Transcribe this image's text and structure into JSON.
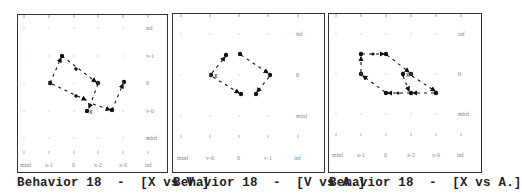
{
  "chart_data": [
    {
      "type": "scatter",
      "title": "Behavior 18  -  [X vs V.]",
      "xlabel": "X",
      "ylabel": "V",
      "x_tick_labels": [
        "minf",
        "x-1",
        "0",
        "x-2",
        "x-0",
        "inf"
      ],
      "y_tick_labels": [
        "inf",
        "v-1",
        "0",
        "v-0",
        "minf"
      ],
      "grid": "dotted",
      "start_marker": "x",
      "trajectory_qualitative": [
        {
          "x": "x-1",
          "y": "v-1"
        },
        {
          "x": "x-2",
          "y": "0"
        },
        {
          "x": "(0,x-2)",
          "y": "v-0"
        },
        {
          "x": "minf..x-1",
          "y": "0"
        },
        {
          "x": "x-2",
          "y": "v-0"
        },
        {
          "x": "x-0",
          "y": "0"
        }
      ]
    },
    {
      "type": "scatter",
      "title": "Behavior 18  -  [V vs A.]",
      "xlabel": "V",
      "ylabel": "A",
      "x_tick_labels": [
        "minf",
        "v-0",
        "0",
        "v-1",
        "inf"
      ],
      "y_tick_labels": [
        "inf",
        "0",
        "minf"
      ],
      "grid": "dotted",
      "start_marker": "x",
      "trajectory_qualitative": [
        {
          "x": "v-0",
          "y": "0"
        },
        {
          "x": "(v-0,0)",
          "y": "(0,inf)"
        },
        {
          "x": "0",
          "y": "(0,inf)"
        },
        {
          "x": "v-1",
          "y": "0"
        },
        {
          "x": "(0,v-1)",
          "y": "(minf,0)"
        },
        {
          "x": "0",
          "y": "(minf,0)"
        }
      ]
    },
    {
      "type": "scatter",
      "title": "Behavior 18  -  [X vs A.]",
      "xlabel": "X",
      "ylabel": "A",
      "x_tick_labels": [
        "minf",
        "x-1",
        "0",
        "x-2",
        "x-0",
        "inf"
      ],
      "y_tick_labels": [
        "inf",
        "0",
        "minf"
      ],
      "grid": "dotted",
      "start_marker": "x",
      "trajectory_qualitative": [
        {
          "x": "x-1",
          "y": "(0,inf)"
        },
        {
          "x": "0",
          "y": "(0,inf)"
        },
        {
          "x": "x-2",
          "y": "0"
        },
        {
          "x": "x-0",
          "y": "(minf,0)"
        },
        {
          "x": "x-2",
          "y": "(minf,0)"
        },
        {
          "x": "0",
          "y": "(minf,0)"
        },
        {
          "x": "x-1",
          "y": "0"
        }
      ]
    }
  ],
  "panels": [
    {
      "caption": "Behavior 18  -  [X vs V.]",
      "x_labels": [
        "minf",
        "x-1",
        "0",
        "x-2",
        "x-0",
        "inf"
      ],
      "y_labels": [
        "inf",
        "v-1",
        "0",
        "v-0",
        "minf"
      ]
    },
    {
      "caption": "Behavior 18  -  [V vs A.]",
      "x_labels": [
        "minf",
        "v-0",
        "0",
        "v-1",
        "inf"
      ],
      "y_labels": [
        "inf",
        "0",
        "minf"
      ]
    },
    {
      "caption": "Behavior 18  -  [X vs A.]",
      "x_labels": [
        "minf",
        "x-1",
        "0",
        "x-2",
        "x-0",
        "inf"
      ],
      "y_labels": [
        "inf",
        "0",
        "minf"
      ]
    }
  ],
  "start_marker_label": "x",
  "colors": {
    "frame": "#333333",
    "trajectory": "#111111",
    "grid": "#aaaaaa",
    "label": "#888888"
  }
}
